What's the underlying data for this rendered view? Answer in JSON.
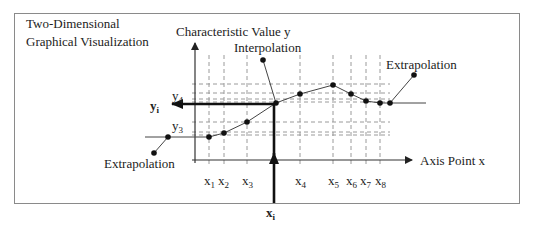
{
  "title": {
    "line1": "Two-Dimensional",
    "line2": "Graphical Visualization"
  },
  "axes": {
    "y_label": "Characteristic Value y",
    "x_label": "Axis Point x"
  },
  "annotations": {
    "interpolation": "Interpolation",
    "extrapolation_left": "Extrapolation",
    "extrapolation_right": "Extrapolation"
  },
  "y_ticks": [
    {
      "base": "y",
      "sub": "4"
    },
    {
      "base": "y",
      "sub": "i"
    },
    {
      "base": "y",
      "sub": "3"
    }
  ],
  "x_ticks": [
    {
      "base": "x",
      "sub": "1"
    },
    {
      "base": "x",
      "sub": "2"
    },
    {
      "base": "x",
      "sub": "3"
    },
    {
      "base": "x",
      "sub": "4"
    },
    {
      "base": "x",
      "sub": "5"
    },
    {
      "base": "x",
      "sub": "6"
    },
    {
      "base": "x",
      "sub": "7"
    },
    {
      "base": "x",
      "sub": "8"
    }
  ],
  "input": {
    "base": "x",
    "sub": "i"
  },
  "colors": {
    "frame": "#8a8a8a",
    "line": "#333333",
    "grid": "#9a9a9a",
    "point": "#111111"
  }
}
